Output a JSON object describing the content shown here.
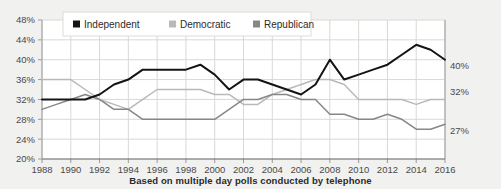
{
  "caption": "Based on multiple day polls conducted by telephone",
  "colors": {
    "background": "#f1f1ef",
    "plot_background": "#ffffff",
    "grid": "#d8d8d6",
    "axis": "#9a9a98",
    "independent": "#141414",
    "democratic": "#b9b9b7",
    "republican": "#878785",
    "tick_text": "#4a4a4a"
  },
  "legend": {
    "position": "top-left",
    "items": [
      {
        "label": "Independent",
        "color": "#141414",
        "marker": "square-marker"
      },
      {
        "label": "Democratic",
        "color": "#b9b9b7",
        "marker": "square-marker"
      },
      {
        "label": "Republican",
        "color": "#878785",
        "marker": "square-marker"
      }
    ]
  },
  "end_labels": [
    {
      "series": "Independent",
      "value": "40%"
    },
    {
      "series": "Democratic",
      "value": "32%"
    },
    {
      "series": "Republican",
      "value": "27%"
    }
  ],
  "chart_data": {
    "type": "line",
    "title": "",
    "subtitle": "",
    "xlabel": "",
    "ylabel": "",
    "xlim": [
      1988,
      2016
    ],
    "ylim": [
      20,
      48
    ],
    "grid": true,
    "legend_position": "top-left",
    "ytick_labels": [
      "48%",
      "44%",
      "40%",
      "36%",
      "32%",
      "28%",
      "24%",
      "20%"
    ],
    "ytick_values": [
      48,
      44,
      40,
      36,
      32,
      28,
      24,
      20
    ],
    "xtick_labels": [
      "1988",
      "1990",
      "1992",
      "1994",
      "1996",
      "1998",
      "2000",
      "2002",
      "2004",
      "2006",
      "2008",
      "2010",
      "2012",
      "2014",
      "2016"
    ],
    "xtick_values": [
      1988,
      1990,
      1992,
      1994,
      1996,
      1998,
      2000,
      2002,
      2004,
      2006,
      2008,
      2010,
      2012,
      2014,
      2016
    ],
    "x": [
      1988,
      1989,
      1990,
      1991,
      1992,
      1993,
      1994,
      1995,
      1996,
      1997,
      1998,
      1999,
      2000,
      2001,
      2002,
      2003,
      2004,
      2005,
      2006,
      2007,
      2008,
      2009,
      2010,
      2011,
      2012,
      2013,
      2014,
      2015,
      2016
    ],
    "series": [
      {
        "name": "Independent",
        "color": "#141414",
        "values": [
          32,
          32,
          32,
          32,
          33,
          35,
          36,
          38,
          38,
          38,
          38,
          39,
          37,
          34,
          36,
          36,
          35,
          34,
          33,
          35,
          40,
          36,
          37,
          38,
          39,
          41,
          43,
          42,
          40
        ]
      },
      {
        "name": "Democratic",
        "color": "#b9b9b7",
        "values": [
          36,
          36,
          36,
          34,
          32,
          31,
          30,
          32,
          34,
          34,
          34,
          34,
          33,
          33,
          31,
          31,
          33,
          34,
          35,
          36,
          36,
          35,
          32,
          32,
          32,
          32,
          31,
          32,
          32
        ]
      },
      {
        "name": "Republican",
        "color": "#878785",
        "values": [
          30,
          31,
          32,
          33,
          32,
          30,
          30,
          28,
          28,
          28,
          28,
          28,
          28,
          30,
          32,
          32,
          33,
          33,
          32,
          32,
          29,
          29,
          28,
          28,
          29,
          28,
          26,
          26,
          27
        ]
      }
    ]
  }
}
